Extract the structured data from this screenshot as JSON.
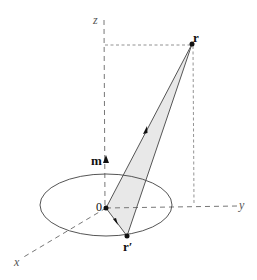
{
  "diagram": {
    "type": "3D vector geometry: magnetic dipole loop with position vectors",
    "axes": {
      "x": {
        "label": "x"
      },
      "y": {
        "label": "y"
      },
      "z": {
        "label": "z"
      }
    },
    "points": {
      "origin": {
        "label": "0"
      },
      "r": {
        "label": "r"
      },
      "r_prime": {
        "label": "r′"
      }
    },
    "vectors": {
      "m": {
        "label": "m"
      }
    },
    "colors": {
      "line": "#555555",
      "shade": "#e8e8e8",
      "point": "#111111",
      "axis": "#777777"
    }
  }
}
